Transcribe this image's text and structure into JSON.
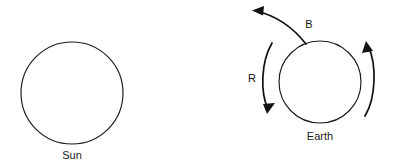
{
  "figure": {
    "background_color": "#ffffff",
    "stroke_color": "#1a1a1a",
    "width": 397,
    "height": 167
  },
  "bodies": {
    "sun": {
      "label": "Sun",
      "center_x": 72,
      "center_y": 93,
      "radius": 51,
      "label_x": 72,
      "label_y": 159
    },
    "earth": {
      "label": "Earth",
      "center_x": 320,
      "center_y": 82,
      "radius": 41,
      "label_x": 320,
      "label_y": 140
    }
  },
  "annotations": {
    "b_vector": {
      "label": "B",
      "label_x": 309,
      "label_y": 28,
      "arrow_path": "M 306 44 C 295 30 278 16 256 11",
      "arrowhead_points": "252,10.5 264,6 263,15.5",
      "description": "curved arrow from Earth upper-left rim sweeping up and to the left"
    },
    "r_vector": {
      "label": "R",
      "label_x": 252,
      "label_y": 82,
      "arrow_path": "M 272 43 C 261 62 260 92 268 109",
      "arrowhead_points": "267,114 275,103 263,104",
      "description": "left-side arc alongside Earth, arrowhead at bottom pointing down-left"
    },
    "right_arc": {
      "label": "",
      "arrow_path": "M 365 116 C 376 98 377 64 368 46",
      "arrowhead_points": "366,41 362,53 373,51",
      "description": "right-side arc alongside Earth, arrowhead at top pointing up-left"
    }
  }
}
